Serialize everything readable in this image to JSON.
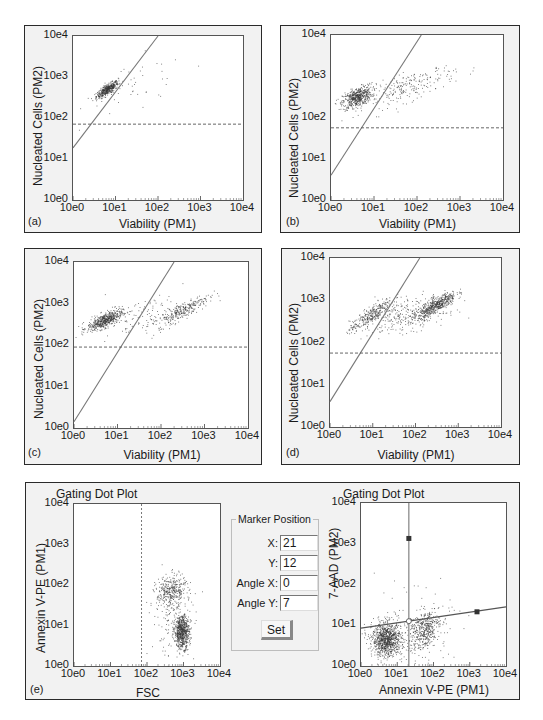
{
  "figure": {
    "panels": [
      {
        "id": "a",
        "letter": "(a)",
        "xlabel": "Viability (PM1)",
        "ylabel": "Nucleated Cells (PM2)"
      },
      {
        "id": "b",
        "letter": "(b)",
        "xlabel": "Viability (PM1)",
        "ylabel": "Nucleated Cells (PM2)"
      },
      {
        "id": "c",
        "letter": "(c)",
        "xlabel": "Viability (PM1)",
        "ylabel": "Nucleated Cells (PM2)"
      },
      {
        "id": "d",
        "letter": "(d)",
        "xlabel": "Viability (PM1)",
        "ylabel": "Nucleated Cells (PM2)"
      }
    ],
    "panel_e": {
      "letter": "(e)",
      "left_plot": {
        "title": "Gating Dot Plot",
        "xlabel": "FSC",
        "ylabel": "Annexin V-PE (PM1)"
      },
      "right_plot": {
        "title": "Gating Dot Plot",
        "xlabel": "Annexin V-PE (PM1)",
        "ylabel": "7-AAD (PM2)"
      },
      "marker_position": {
        "title": "Marker Position",
        "fields": [
          {
            "label": "X:",
            "value": "21"
          },
          {
            "label": "Y:",
            "value": "12"
          },
          {
            "label": "Angle X:",
            "value": "0"
          },
          {
            "label": "Angle Y:",
            "value": "7"
          }
        ],
        "set_button": "Set"
      }
    },
    "tick_labels": [
      "10e0",
      "10e1",
      "10e2",
      "10e3",
      "10e4"
    ],
    "colors": {
      "dots": "#3a3a3a",
      "gate_line": "#777777",
      "dashed_line": "#555555",
      "panel_bg": "#f2f2f2"
    }
  },
  "chart_data": [
    {
      "id": "a",
      "type": "scatter",
      "title": "",
      "xlabel": "Viability (PM1)",
      "ylabel": "Nucleated Cells (PM2)",
      "xscale": "log",
      "yscale": "log",
      "xlim": [
        1,
        10000
      ],
      "ylim": [
        1,
        10000
      ],
      "x_ticks": [
        "10e0",
        "10e1",
        "10e2",
        "10e3",
        "10e4"
      ],
      "y_ticks": [
        "10e0",
        "10e1",
        "10e2",
        "10e3",
        "10e4"
      ],
      "gate_line": {
        "from_log": [
          0,
          1.27
        ],
        "to_log": [
          2.0,
          4.0
        ]
      },
      "threshold_log_y": 1.85,
      "clusters_log": [
        {
          "cx": 0.8,
          "cy": 2.7,
          "sx": 0.13,
          "sy": 0.1,
          "rho": 0.8,
          "n": 420
        },
        {
          "cx": 1.5,
          "cy": 2.8,
          "sx": 0.6,
          "sy": 0.35,
          "rho": 0.3,
          "n": 45
        }
      ]
    },
    {
      "id": "b",
      "type": "scatter",
      "xlabel": "Viability (PM1)",
      "ylabel": "Nucleated Cells (PM2)",
      "xscale": "log",
      "yscale": "log",
      "xlim": [
        1,
        10000
      ],
      "ylim": [
        1,
        10000
      ],
      "x_ticks": [
        "10e0",
        "10e1",
        "10e2",
        "10e3",
        "10e4"
      ],
      "y_ticks": [
        "10e0",
        "10e1",
        "10e2",
        "10e3",
        "10e4"
      ],
      "gate_line": {
        "from_log": [
          0,
          0.6
        ],
        "to_log": [
          2.1,
          4.0
        ]
      },
      "threshold_log_y": 1.75,
      "clusters_log": [
        {
          "cx": 0.6,
          "cy": 2.5,
          "sx": 0.17,
          "sy": 0.13,
          "rho": 0.5,
          "n": 520
        },
        {
          "cx": 1.8,
          "cy": 2.75,
          "sx": 0.55,
          "sy": 0.25,
          "rho": 0.75,
          "n": 230
        }
      ]
    },
    {
      "id": "c",
      "type": "scatter",
      "xlabel": "Viability (PM1)",
      "ylabel": "Nucleated Cells (PM2)",
      "xscale": "log",
      "yscale": "log",
      "xlim": [
        1,
        10000
      ],
      "ylim": [
        1,
        10000
      ],
      "x_ticks": [
        "10e0",
        "10e1",
        "10e2",
        "10e3",
        "10e4"
      ],
      "y_ticks": [
        "10e0",
        "10e1",
        "10e2",
        "10e3",
        "10e4"
      ],
      "gate_line": {
        "from_log": [
          0,
          0.15
        ],
        "to_log": [
          2.3,
          4.0
        ]
      },
      "threshold_log_y": 1.95,
      "clusters_log": [
        {
          "cx": 0.7,
          "cy": 2.6,
          "sx": 0.2,
          "sy": 0.12,
          "rho": 0.7,
          "n": 520
        },
        {
          "cx": 2.5,
          "cy": 2.85,
          "sx": 0.3,
          "sy": 0.18,
          "rho": 0.85,
          "n": 260
        },
        {
          "cx": 1.7,
          "cy": 2.7,
          "sx": 0.5,
          "sy": 0.25,
          "rho": 0.5,
          "n": 130
        }
      ]
    },
    {
      "id": "d",
      "type": "scatter",
      "xlabel": "Viability (PM1)",
      "ylabel": "Nucleated Cells (PM2)",
      "xscale": "log",
      "yscale": "log",
      "xlim": [
        1,
        10000
      ],
      "ylim": [
        1,
        10000
      ],
      "x_ticks": [
        "10e0",
        "10e1",
        "10e2",
        "10e3",
        "10e4"
      ],
      "y_ticks": [
        "10e0",
        "10e1",
        "10e2",
        "10e3",
        "10e4"
      ],
      "gate_line": {
        "from_log": [
          0,
          0.6
        ],
        "to_log": [
          2.1,
          4.0
        ]
      },
      "threshold_log_y": 1.75,
      "clusters_log": [
        {
          "cx": 0.95,
          "cy": 2.65,
          "sx": 0.25,
          "sy": 0.2,
          "rho": 0.85,
          "n": 300
        },
        {
          "cx": 2.5,
          "cy": 2.9,
          "sx": 0.22,
          "sy": 0.15,
          "rho": 0.8,
          "n": 480
        },
        {
          "cx": 1.8,
          "cy": 2.65,
          "sx": 0.45,
          "sy": 0.2,
          "rho": 0.4,
          "n": 280
        }
      ]
    },
    {
      "id": "e-left",
      "type": "scatter",
      "title": "Gating Dot Plot",
      "xlabel": "FSC",
      "ylabel": "Annexin V-PE (PM1)",
      "xscale": "log",
      "yscale": "log",
      "xlim": [
        1,
        10000
      ],
      "ylim": [
        1,
        10000
      ],
      "x_ticks": [
        "10e0",
        "10e1",
        "10e2",
        "10e3",
        "10e4"
      ],
      "y_ticks": [
        "10e0",
        "10e1",
        "10e2",
        "10e3",
        "10e4"
      ],
      "vertical_dashed_log_x": 1.85,
      "clusters_log": [
        {
          "cx": 2.65,
          "cy": 1.85,
          "sx": 0.2,
          "sy": 0.2,
          "rho": 0.2,
          "n": 320
        },
        {
          "cx": 2.95,
          "cy": 0.85,
          "sx": 0.1,
          "sy": 0.2,
          "rho": 0.0,
          "n": 650
        },
        {
          "cx": 2.7,
          "cy": 1.2,
          "sx": 0.3,
          "sy": 0.5,
          "rho": 0.0,
          "n": 160
        }
      ]
    },
    {
      "id": "e-right",
      "type": "scatter",
      "title": "Gating Dot Plot",
      "xlabel": "Annexin V-PE (PM1)",
      "ylabel": "7-AAD (PM2)",
      "xscale": "log",
      "yscale": "log",
      "xlim": [
        1,
        10000
      ],
      "ylim": [
        1,
        10000
      ],
      "x_ticks": [
        "10e0",
        "10e1",
        "10e2",
        "10e3",
        "10e4"
      ],
      "y_ticks": [
        "10e0",
        "10e1",
        "10e2",
        "10e3",
        "10e4"
      ],
      "marker": {
        "x": 21,
        "y": 12,
        "angle_x": 0,
        "angle_y": 7
      },
      "vertical_line_log_x": 1.32,
      "angled_line": {
        "from_log": [
          0,
          0.93
        ],
        "to_log": [
          4.0,
          1.45
        ]
      },
      "handles_log": [
        {
          "shape": "square",
          "x": 1.32,
          "y": 3.13
        },
        {
          "shape": "square",
          "x": 3.2,
          "y": 1.33
        },
        {
          "shape": "circle",
          "x": 1.32,
          "y": 1.1
        }
      ],
      "clusters_log": [
        {
          "cx": 0.7,
          "cy": 0.65,
          "sx": 0.2,
          "sy": 0.2,
          "rho": 0.0,
          "n": 900
        },
        {
          "cx": 1.75,
          "cy": 0.9,
          "sx": 0.2,
          "sy": 0.25,
          "rho": 0.3,
          "n": 420
        },
        {
          "cx": 1.3,
          "cy": 0.8,
          "sx": 0.6,
          "sy": 0.5,
          "rho": 0.0,
          "n": 150
        }
      ]
    }
  ]
}
